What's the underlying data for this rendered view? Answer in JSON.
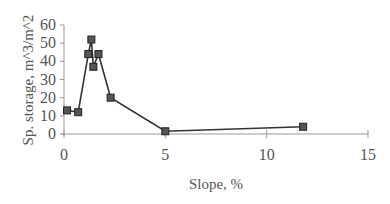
{
  "chart_data": {
    "type": "line",
    "title": "",
    "xlabel": "Slope, %",
    "ylabel": "Sp. storage, m^3/m^2",
    "xlim": [
      0,
      15
    ],
    "ylim": [
      0,
      60
    ],
    "xticks": [
      "0",
      "5",
      "10",
      "15"
    ],
    "yticks": [
      "0",
      "10",
      "20",
      "30",
      "40",
      "50",
      "60"
    ],
    "grid": false,
    "legend": null,
    "series": [
      {
        "name": "Sp. storage",
        "marker": "square",
        "color": "#555555",
        "x": [
          0.15,
          0.7,
          1.2,
          1.35,
          1.45,
          1.7,
          2.3,
          5.0,
          11.8
        ],
        "y": [
          13,
          12,
          44,
          52,
          37,
          44,
          20,
          1.5,
          4
        ]
      }
    ]
  }
}
